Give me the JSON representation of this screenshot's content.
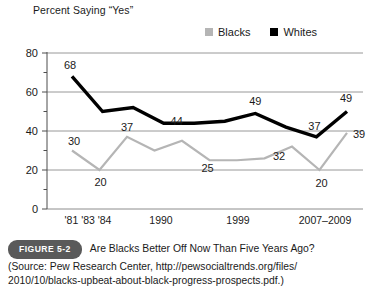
{
  "chart_data": {
    "type": "line",
    "title": "Percent Saying “Yes”",
    "xlabel": "",
    "ylabel": "",
    "ylim": [
      0,
      80
    ],
    "yticks": [
      0,
      20,
      40,
      60,
      80
    ],
    "ytick_labels": [
      "0",
      "20",
      "40",
      "60",
      "80"
    ],
    "yminor_ticks": [
      10,
      30,
      50,
      70
    ],
    "grid": "horizontal",
    "legend_position": "top-right",
    "x_axis_labels": [
      "'81 '83 '84",
      "1990",
      "1999",
      "2007–2009"
    ],
    "x_index": [
      0,
      1,
      2,
      3,
      4,
      5,
      6,
      7,
      8,
      9
    ],
    "series": [
      {
        "name": "Blacks",
        "color": "#b5b5b5",
        "values": [
          30,
          20,
          37,
          30,
          35,
          25,
          25,
          26,
          32,
          20,
          39
        ],
        "labeled_points": [
          {
            "index": 0,
            "value": 30,
            "label": "30"
          },
          {
            "index": 1,
            "value": 20,
            "label": "20"
          },
          {
            "index": 2,
            "value": 37,
            "label": "37"
          },
          {
            "index": 5,
            "value": 25,
            "label": "25"
          },
          {
            "index": 8,
            "value": 32,
            "label": "32"
          },
          {
            "index": 9,
            "value": 20,
            "label": "20"
          },
          {
            "index": 10,
            "value": 39,
            "label": "39"
          }
        ]
      },
      {
        "name": "Whites",
        "color": "#000000",
        "values": [
          68,
          50,
          52,
          44,
          44,
          45,
          49,
          42,
          37,
          50
        ],
        "labeled_points": [
          {
            "index": 0,
            "value": 68,
            "label": "68"
          },
          {
            "index": 3,
            "value": 44,
            "label": "44"
          },
          {
            "index": 6,
            "value": 49,
            "label": "49"
          },
          {
            "index": 8,
            "value": 37,
            "label": "37"
          },
          {
            "index": 9,
            "value": 50,
            "label": "49"
          }
        ]
      }
    ]
  },
  "legend": {
    "entries": [
      {
        "label": "Blacks",
        "swatch_color": "#b5b5b5"
      },
      {
        "label": "Whites",
        "swatch_color": "#000000"
      }
    ]
  },
  "caption": {
    "badge": "FIGURE 5-2",
    "heading": "Are Blacks Better Off Now Than Five Years Ago?",
    "source": "(Source: Pew Research Center, http://pewsocialtrends.org/files/\n2010/10/blacks-upbeat-about-black-progress-prospects.pdf.)"
  },
  "colors": {
    "gridline": "#8c8c8c",
    "axis": "#4d4d4d",
    "blacks_series": "#b5b5b5",
    "whites_series": "#000000",
    "badge_background": "#5a5a5a",
    "text": "#1a1a1a"
  }
}
